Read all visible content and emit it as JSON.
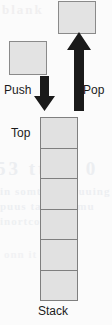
{
  "diagram": {
    "colors": {
      "box_fill": "#e3e3e3",
      "box_border": "#8a8a8a",
      "cell_fill": "#e1e1e1",
      "cell_border": "#7f7f7f",
      "arrow": "#1a1a1a",
      "text": "#1b1b1b",
      "background": "#fbfbfb"
    },
    "labels": {
      "push": "Push",
      "pop": "Pop",
      "top": "Top",
      "stack": "Stack"
    },
    "elements": {
      "incoming_box": "",
      "outgoing_box": ""
    },
    "arrows": [
      {
        "name": "push-arrow",
        "direction": "down",
        "label": "Push"
      },
      {
        "name": "pop-arrow",
        "direction": "up",
        "label": "Pop"
      }
    ],
    "stack": {
      "cell_count": 6,
      "cells": [
        "",
        "",
        "",
        "",
        "",
        ""
      ]
    },
    "bleed_through": {
      "line1": "blank",
      "line2": "53 tts 1 0",
      "line3": "in somt tith wuuing",
      "line4": "puus tait 105 mu",
      "line5": "inortco t 1 eo",
      "line6": "onn it"
    }
  }
}
